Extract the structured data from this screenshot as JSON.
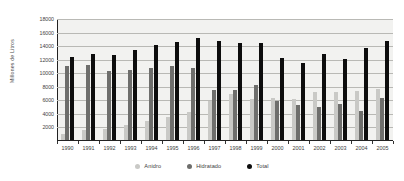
{
  "chart_data": {
    "type": "bar",
    "title": "",
    "subtitle": "",
    "xlabel": "",
    "ylabel": "Millones de Litros",
    "ylim": [
      0,
      18000
    ],
    "ytick_step": 2000,
    "yticks": [
      2000,
      4000,
      6000,
      8000,
      10000,
      12000,
      14000,
      16000,
      18000
    ],
    "ytick_labels": [
      "2000",
      "4000",
      "6000",
      "8000",
      "10000",
      "12000",
      "14000",
      "16000",
      "18000"
    ],
    "grid": true,
    "grid_axis": "y",
    "legend_position": "bottom",
    "categories": [
      "1990",
      "1991",
      "1992",
      "1993",
      "1994",
      "1995",
      "1996",
      "1997",
      "1998",
      "1999",
      "2000",
      "2001",
      "2002",
      "2003",
      "2004",
      "2005"
    ],
    "series": [
      {
        "name": "Anidro",
        "color": "#c9c9c6",
        "values": [
          1000,
          1600,
          1750,
          2350,
          2950,
          3500,
          4300,
          5900,
          6900,
          6200,
          6400,
          6200,
          7300,
          7300,
          7400,
          7700
        ]
      },
      {
        "name": "Hidratado",
        "color": "#6e6e6c",
        "values": [
          11050,
          11200,
          10350,
          10500,
          10750,
          11000,
          10800,
          7600,
          7600,
          8300,
          5850,
          5350,
          5000,
          5400,
          4500,
          6300
        ]
      },
      {
        "name": "Total",
        "color": "#0d0d0d",
        "values": [
          12450,
          12850,
          12700,
          13400,
          14200,
          14600,
          15150,
          14750,
          14450,
          14450,
          12200,
          11500,
          12800,
          12100,
          13650,
          14800
        ]
      }
    ]
  },
  "legend": {
    "items": [
      {
        "label": "Anidro",
        "color": "#c9c9c6"
      },
      {
        "label": "Hidratado",
        "color": "#6e6e6c"
      },
      {
        "label": "Total",
        "color": "#0d0d0d"
      }
    ]
  }
}
